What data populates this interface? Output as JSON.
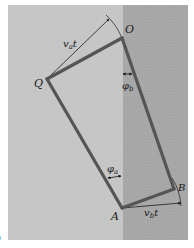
{
  "figure": {
    "panel": {
      "light_region_color": "#c6c6c6",
      "dark_region_color": "#a9a9a9",
      "frame_color": "#ffffff"
    },
    "edge_color": "#555555",
    "annotation_color": "#1a1a1a",
    "points": {
      "O": {
        "label": "O",
        "x": 122,
        "y": 38
      },
      "Q": {
        "label": "Q",
        "x": 47,
        "y": 79
      },
      "A": {
        "label": "A",
        "x": 122,
        "y": 208
      },
      "B": {
        "label": "B",
        "x": 174,
        "y": 189
      }
    },
    "labels": {
      "va_t": {
        "base": "v",
        "sub": "a",
        "suffix": "t"
      },
      "vb_t": {
        "base": "v",
        "sub": "b",
        "suffix": "t"
      },
      "phi_b": {
        "base": "φ",
        "sub": "b"
      },
      "phi_a": {
        "base": "φ",
        "sub": "a"
      },
      "O": "O",
      "Q": "Q",
      "A": "A",
      "B": "B"
    },
    "partial_caption": ")"
  }
}
